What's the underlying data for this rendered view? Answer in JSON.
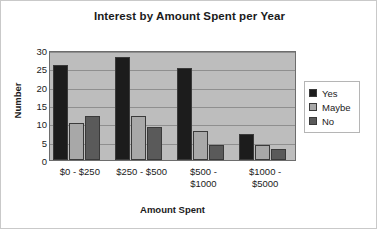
{
  "chart_data": {
    "type": "bar",
    "title": "Interest by Amount Spent per Year",
    "xlabel": "Amount Spent",
    "ylabel": "Number",
    "categories": [
      "$0 - $250",
      "$250 - $500",
      "$500 - $1000",
      "$1000 - $5000"
    ],
    "category_lines": [
      [
        "$0 - $250"
      ],
      [
        "$250 - $500"
      ],
      [
        "$500 -",
        "$1000"
      ],
      [
        "$1000 -",
        "$5000"
      ]
    ],
    "series": [
      {
        "name": "Yes",
        "color": "#1c1c1c",
        "values": [
          26,
          28,
          25,
          7
        ]
      },
      {
        "name": "Maybe",
        "color": "#a8a8a8",
        "values": [
          10,
          12,
          8,
          4
        ]
      },
      {
        "name": "No",
        "color": "#5a5a5a",
        "values": [
          12,
          9,
          4,
          3
        ]
      }
    ],
    "ylim": [
      0,
      30
    ],
    "ytick_labels": [
      "0",
      "5",
      "10",
      "15",
      "20",
      "25",
      "30"
    ],
    "ytick_values": [
      0,
      5,
      10,
      15,
      20,
      25,
      30
    ],
    "grid": true,
    "grid_axis": "y",
    "legend_position": "right",
    "plot_background": "#bdbdbd",
    "figure_background": "#ffffff"
  }
}
